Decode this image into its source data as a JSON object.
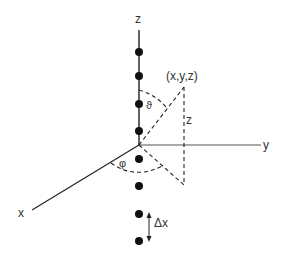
{
  "diagram": {
    "type": "spherical-coordinates-with-line-of-points",
    "axes": {
      "z_label": "z",
      "y_label": "y",
      "x_label": "x"
    },
    "point_label": "(x,y,z)",
    "height_label": "z",
    "polar_angle_label": "ϑ",
    "azimuth_angle_label": "φ",
    "spacing_label": "Δx",
    "dots_above_origin": 4,
    "dots_below_origin": 4,
    "colors": {
      "line": "#222222",
      "dot": "#111111",
      "text": "#333333"
    }
  }
}
